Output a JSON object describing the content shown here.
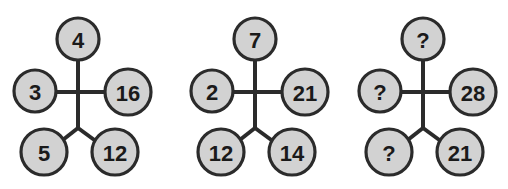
{
  "board": {
    "title": "Number Puzzle Diagrams",
    "background_color": "#ffffff",
    "node_fill_color": "#d2d2d2",
    "node_stroke_color": "#2b2b2b",
    "line_color": "#2b2b2b",
    "label_color": "#1a1a1a",
    "unknown_token": "?"
  },
  "figures": [
    {
      "id": "figure-1",
      "name": "puzzle-figure-1",
      "nodes": {
        "top": "4",
        "left": "3",
        "right": "16",
        "bottom_left": "5",
        "bottom_right": "12"
      }
    },
    {
      "id": "figure-2",
      "name": "puzzle-figure-2",
      "nodes": {
        "top": "7",
        "left": "2",
        "right": "21",
        "bottom_left": "12",
        "bottom_right": "14"
      }
    },
    {
      "id": "figure-3",
      "name": "puzzle-figure-3",
      "nodes": {
        "top": "?",
        "left": "?",
        "right": "28",
        "bottom_left": "?",
        "bottom_right": "21"
      }
    }
  ]
}
